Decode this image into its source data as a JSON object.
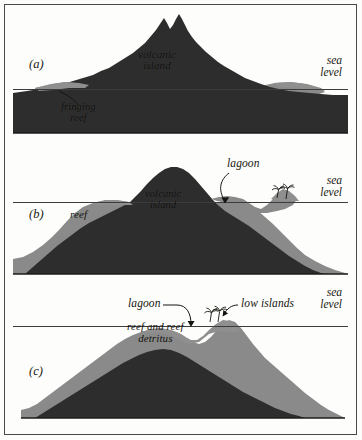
{
  "figure": {
    "colors": {
      "background": "#fdfdfb",
      "volcanic_rock": "#2d2d2d",
      "reef": "#8a8a8a",
      "sea_level_line": "#3c3c3c",
      "frame": "#4a4a45",
      "label_text": "#16160f"
    }
  },
  "panels": [
    {
      "tag": "(a)",
      "stage": "fringing-reef",
      "sea_level": {
        "line1": "sea",
        "line2": "level"
      },
      "labels": {
        "volcanic_line1": "volcanic",
        "volcanic_line2": "island",
        "fringing_line1": "fringing",
        "fringing_line2": "reef"
      }
    },
    {
      "tag": "(b)",
      "stage": "barrier-reef",
      "sea_level": {
        "line1": "sea",
        "line2": "level"
      },
      "labels": {
        "volcanic_line1": "volcanic",
        "volcanic_line2": "island",
        "reef": "reef",
        "lagoon": "lagoon"
      }
    },
    {
      "tag": "(c)",
      "stage": "atoll",
      "sea_level": {
        "line1": "sea",
        "line2": "level"
      },
      "labels": {
        "lagoon": "lagoon",
        "low_islands": "low islands",
        "detritus_line1": "reef and reef",
        "detritus_line2": "detritus"
      }
    }
  ]
}
